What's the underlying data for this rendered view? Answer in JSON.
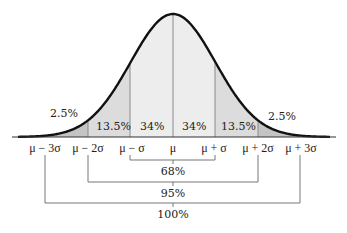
{
  "chart_data": {
    "type": "area",
    "distribution": "normal",
    "x_tick_labels": [
      "μ − 3σ",
      "μ − 2σ",
      "μ − σ",
      "μ",
      "μ + σ",
      "μ + 2σ",
      "μ + 3σ"
    ],
    "regions": [
      {
        "from": "μ − 3σ",
        "to": "μ − 2σ",
        "percent": "2.5%",
        "value": 2.5
      },
      {
        "from": "μ − 2σ",
        "to": "μ − σ",
        "percent": "13.5%",
        "value": 13.5
      },
      {
        "from": "μ − σ",
        "to": "μ",
        "percent": "34%",
        "value": 34
      },
      {
        "from": "μ",
        "to": "μ + σ",
        "percent": "34%",
        "value": 34
      },
      {
        "from": "μ + σ",
        "to": "μ + 2σ",
        "percent": "13.5%",
        "value": 13.5
      },
      {
        "from": "μ + 2σ",
        "to": "μ + 3σ",
        "percent": "2.5%",
        "value": 2.5
      }
    ],
    "brackets": [
      {
        "from": "μ − σ",
        "to": "μ + σ",
        "label": "68%",
        "value": 68
      },
      {
        "from": "μ − 2σ",
        "to": "μ + 2σ",
        "label": "95%",
        "value": 95
      },
      {
        "from": "μ − 3σ",
        "to": "μ + 3σ",
        "label": "100%",
        "value": 100
      }
    ],
    "grid": false,
    "legend": null
  },
  "labels": {
    "region_left_tail": "2.5%",
    "region_left_13": "13.5%",
    "region_left_34": "34%",
    "region_right_34": "34%",
    "region_right_13": "13.5%",
    "region_right_tail": "2.5%",
    "tick_m3": "μ − 3σ",
    "tick_m2": "μ − 2σ",
    "tick_m1": "μ − σ",
    "tick_0": "μ",
    "tick_p1": "μ + σ",
    "tick_p2": "μ + 2σ",
    "tick_p3": "μ + 3σ",
    "bracket_68": "68%",
    "bracket_95": "95%",
    "bracket_100": "100%"
  },
  "colors": {
    "curve": "#111111",
    "inner_fill": "#ededed",
    "middle_fill": "#dcdcdc",
    "tail_fill": "#c4c4c4",
    "divider": "#8a8a8a",
    "bracket": "#777777"
  }
}
